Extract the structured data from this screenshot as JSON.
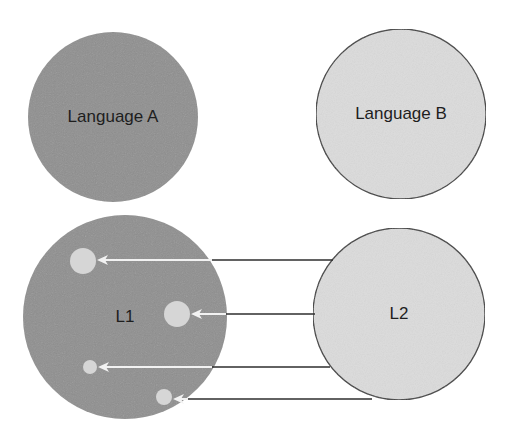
{
  "diagram": {
    "type": "language-transfer-mapping",
    "colors": {
      "background": "#ffffff",
      "dark_fill": "#8f8f8f",
      "light_fill": "#dcdcdc",
      "small_circle_fill": "#d6d6d6",
      "outline": "#3a3a3a",
      "connector_dark": "#2e2e2e",
      "connector_light": "#f2f2f2",
      "text": "#1e1e1e"
    },
    "top_row": {
      "language_a": {
        "label": "Language A",
        "cx": 113,
        "cy": 117,
        "r": 85,
        "fill": "dark"
      },
      "language_b": {
        "label": "Language B",
        "cx": 401,
        "cy": 114,
        "r": 85,
        "fill": "light"
      }
    },
    "bottom_row": {
      "l1": {
        "label": "L1",
        "cx": 125,
        "cy": 317,
        "r": 102,
        "fill": "dark"
      },
      "l2": {
        "label": "L2",
        "cx": 399,
        "cy": 314,
        "r": 86,
        "fill": "light"
      },
      "transfer_points": [
        {
          "cx": 83,
          "cy": 261,
          "r": 13
        },
        {
          "cx": 177,
          "cy": 314,
          "r": 13
        },
        {
          "cx": 90,
          "cy": 367,
          "r": 7
        },
        {
          "cx": 164,
          "cy": 397,
          "r": 8
        }
      ],
      "arrows": [
        {
          "y": 260,
          "from_x": 333,
          "boundary_x": 212,
          "to_x": 97
        },
        {
          "y": 314,
          "from_x": 315,
          "boundary_x": 226,
          "to_x": 191
        },
        {
          "y": 367,
          "from_x": 330,
          "boundary_x": 212,
          "to_x": 98
        },
        {
          "y": 399,
          "from_x": 372,
          "boundary_x": 188,
          "to_x": 173
        }
      ]
    }
  }
}
